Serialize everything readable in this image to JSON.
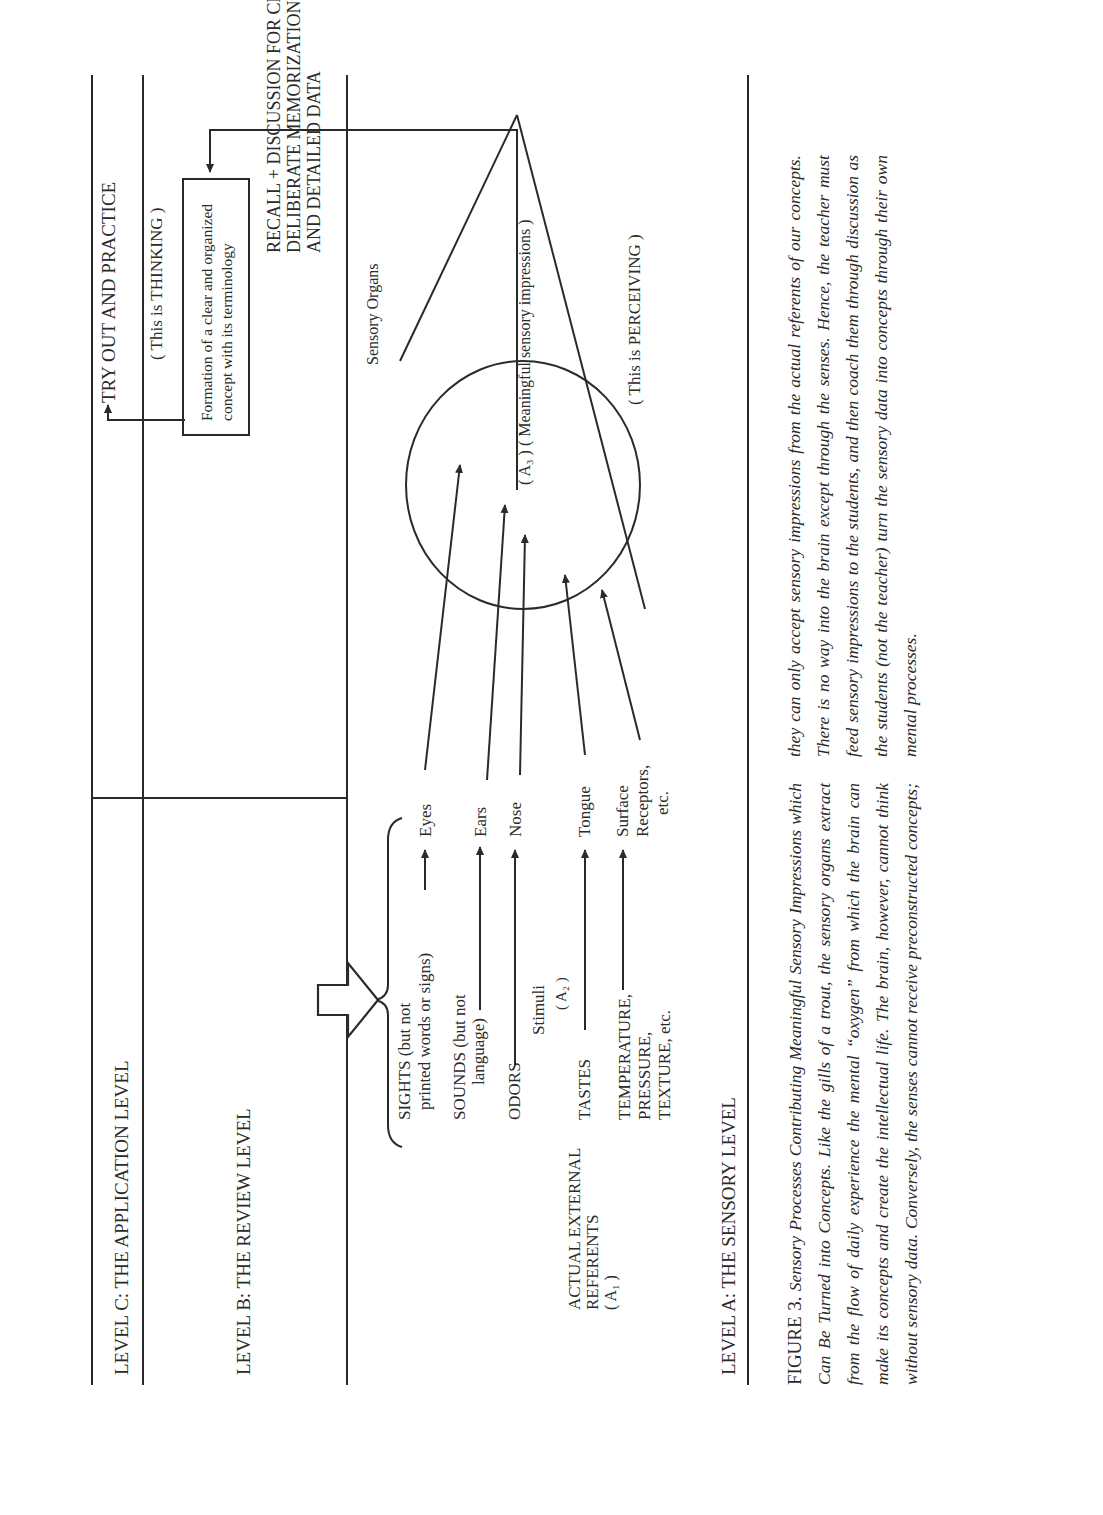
{
  "levels": {
    "c": "LEVEL C:  THE APPLICATION LEVEL",
    "b": "LEVEL B:  THE REVIEW LEVEL",
    "a": "LEVEL A:  THE SENSORY LEVEL"
  },
  "application": {
    "try_out": "TRY OUT AND PRACTICE",
    "thinking": "( This is THINKING )",
    "formation_line1": "Formation of a clear and organized",
    "formation_line2": "concept with its terminology"
  },
  "review": {
    "line1": "RECALL + DISCUSSION FOR CLARIFICATION +",
    "line2": "DELIBERATE MEMORIZATION OF SYMBOLS",
    "line3": "AND DETAILED DATA"
  },
  "sensory": {
    "sensory_organs": "Sensory Organs",
    "meaningful": "( A₃ )  ( Meaningful sensory impressions )",
    "perceiving": "( This is PERCEIVING )",
    "referents_line1": "ACTUAL EXTERNAL",
    "referents_line2": "REFERENTS",
    "referents_line3": "( A₁ )",
    "stimuli_line1": "Stimuli",
    "stimuli_line2": "( A₂ )",
    "stimuli": [
      {
        "lines": [
          "SIGHTS (but not",
          "printed words or signs)"
        ],
        "organ": [
          "Eyes"
        ]
      },
      {
        "lines": [
          "SOUNDS (but not",
          "language)"
        ],
        "organ": [
          "Ears"
        ]
      },
      {
        "lines": [
          "ODORS"
        ],
        "organ": [
          "Nose"
        ]
      },
      {
        "lines": [
          "TASTES"
        ],
        "organ": [
          "Tongue"
        ]
      },
      {
        "lines": [
          "TEMPERATURE,",
          "PRESSURE,",
          "TEXTURE, etc."
        ],
        "organ": [
          "Surface",
          "Receptors,",
          "etc."
        ]
      }
    ]
  },
  "caption": {
    "figure_label": "FIGURE 3.",
    "title": "Sensory Processes Contributing Meaningful Sensory Impressions which Can Be Turned into Concepts.",
    "body": "Like the gills of a trout, the sensory organs extract from the flow of daily experience the mental “oxygen” from which the brain can make its concepts and create the intellectual life. The brain, however, cannot think without sensory data. Conversely, the senses cannot receive preconstructed concepts; they can only accept sensory impressions from the actual referents of our concepts. There is no way into the brain except through the senses. Hence, the teacher must feed sensory impressions to the students, and then coach them through discussion as the students (not the teacher) turn the sensory data into concepts through their own mental processes."
  }
}
